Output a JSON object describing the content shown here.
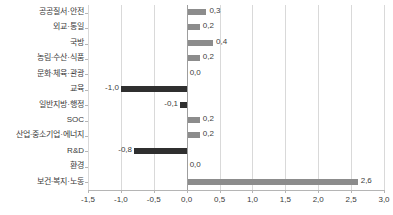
{
  "chart_data": {
    "type": "bar",
    "orientation": "horizontal",
    "title": "",
    "subtitle": "",
    "xlabel": "",
    "ylabel": "",
    "xlim": [
      -1.5,
      3.0
    ],
    "xticks": [
      -1.5,
      -1.0,
      -0.5,
      0.0,
      0.5,
      1.0,
      1.5,
      2.0,
      2.5,
      3.0
    ],
    "xtick_labels": [
      "-1,5",
      "-1,0",
      "-0,5",
      "0,0",
      "0,5",
      "1,0",
      "1,5",
      "2,0",
      "2,5",
      "3,0"
    ],
    "grid": true,
    "legend": false,
    "decimal_separator": ",",
    "categories": [
      "공공질서·안전",
      "외교·통일",
      "국방",
      "농림·수산·식품",
      "문화·체육·관광",
      "교육",
      "일반지방·행정",
      "SOC",
      "산업·중소기업·에너지",
      "R&D",
      "환경",
      "보건·복지·노동"
    ],
    "values": [
      0.3,
      0.2,
      0.4,
      0.2,
      0.0,
      -1.0,
      -0.1,
      0.2,
      0.2,
      -0.8,
      0.0,
      2.6
    ],
    "value_labels": [
      "0,3",
      "0,2",
      "0,4",
      "0,2",
      "0,0",
      "-1,0",
      "-0,1",
      "0,2",
      "0,2",
      "-0,8",
      "0,0",
      "2,6"
    ],
    "colors": {
      "positive_bar": "#8c8c8c",
      "negative_bar": "#2f2f2f",
      "gridline": "#d9d9d9",
      "zero_line": "#9e9e9e",
      "axis": "#b5b5b5",
      "text": "#3a3a3a",
      "background": "#ffffff"
    }
  }
}
